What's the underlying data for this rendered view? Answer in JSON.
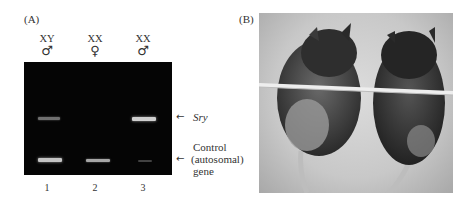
{
  "panel_a": {
    "label": "(A)",
    "lanes": [
      {
        "genotype": "XY",
        "sex_symbol": "♂",
        "number": "1",
        "sry_intensity": 0.55,
        "control_intensity": 0.85
      },
      {
        "genotype": "XX",
        "sex_symbol": "♀",
        "number": "2",
        "sry_intensity": 0.0,
        "control_intensity": 0.75
      },
      {
        "genotype": "XX",
        "sex_symbol": "♂",
        "number": "3",
        "sry_intensity": 0.9,
        "control_intensity": 0.3
      }
    ],
    "annotations": {
      "sry": "Sry",
      "control_line1": "Control",
      "control_line2": "(autosomal)",
      "control_line3": "gene",
      "arrow": "←"
    }
  },
  "panel_b": {
    "label": "(B)",
    "description": "Photograph of two mice hanging from a horizontal bar"
  }
}
